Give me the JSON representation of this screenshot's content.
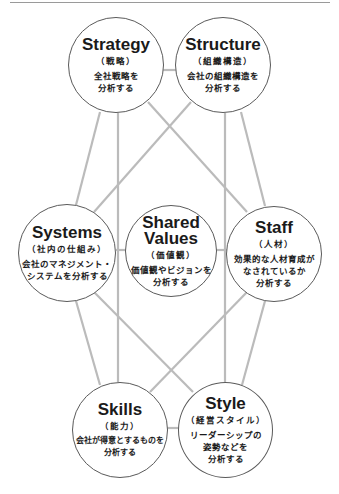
{
  "diagram": {
    "colors": {
      "line": "#bbbbbb",
      "circle_border": "#5a5a5a",
      "text": "#1a1a1a",
      "background": "#ffffff"
    },
    "nodes": {
      "strategy": {
        "en": "Strategy",
        "jp": "（戦略）",
        "desc": "全社戦略を\n分析する"
      },
      "structure": {
        "en": "Structure",
        "jp": "（組織構造）",
        "desc": "会社の組織構造を\n分析する"
      },
      "systems": {
        "en": "Systems",
        "jp": "（社内の仕組み）",
        "desc": "会社のマネジメント・\nシステムを分析する"
      },
      "shared_values": {
        "en": "Shared\nValues",
        "jp": "（価値観）",
        "desc": "価値観やビジョンを\n分析する"
      },
      "staff": {
        "en": "Staff",
        "jp": "（人材）",
        "desc": "効果的な人材育成が\nなされているか\n分析する"
      },
      "skills": {
        "en": "Skills",
        "jp": "（能力）",
        "desc": "会社が得意とするものを\n分析する"
      },
      "style": {
        "en": "Style",
        "jp": "（経営スタイル）",
        "desc": "リーダーシップの\n姿勢などを\n分析する"
      }
    }
  }
}
